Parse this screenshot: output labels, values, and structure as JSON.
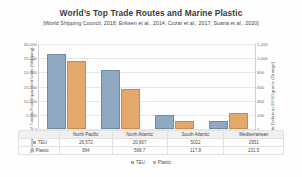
{
  "chart_data": {
    "type": "bar",
    "title": "World’s Top Trade Routes and Marine Plastic",
    "subtitle": "[World Shipping Council, 2018; Eriksen et al., 2014; Cozar et al., 2017; Suaria et al., 2020]",
    "categories": [
      "North Pacific",
      "North Atlantic",
      "South Atlantic",
      "Mediterranean"
    ],
    "series": [
      {
        "name": "TEU",
        "axis": "left",
        "color": "#8ea9c1",
        "values": [
          26572,
          20807,
          5022,
          2951
        ]
      },
      {
        "name": "Plastic",
        "axis": "right",
        "color": "#e3a86a",
        "values": [
          964,
          568.7,
          117.8,
          231.5
        ]
      }
    ],
    "xlabel": "",
    "ylabel": "Thousands of Twenty-Foot Equivalent Units (Shipping)",
    "y2label": "Plastic Debris in 10^10 grams (Orange)",
    "ylim": [
      0,
      30000
    ],
    "y2lim": [
      0,
      1200
    ],
    "yticks": [
      "30,000",
      "25,000",
      "20,000",
      "15,000",
      "10,000",
      "5,000",
      "0"
    ],
    "y2ticks": [
      "1,200",
      "1,000",
      "800",
      "600",
      "400",
      "200",
      "0"
    ],
    "grid": true,
    "legend_position": "bottom"
  },
  "table": {
    "columns": [
      "",
      "North Pacific",
      "North Atlantic",
      "South Atlantic",
      "Mediterranean"
    ],
    "rows": [
      {
        "label": "TEU",
        "values": [
          "26,572",
          "20,807",
          "5022",
          "2951"
        ]
      },
      {
        "label": "Plastic",
        "values": [
          "964",
          "568.7",
          "117.8",
          "231.5"
        ]
      }
    ]
  },
  "legend": {
    "items": [
      {
        "label": "TEU",
        "color": "#8ea9c1"
      },
      {
        "label": "Plastic",
        "color": "#e3a86a"
      }
    ]
  }
}
